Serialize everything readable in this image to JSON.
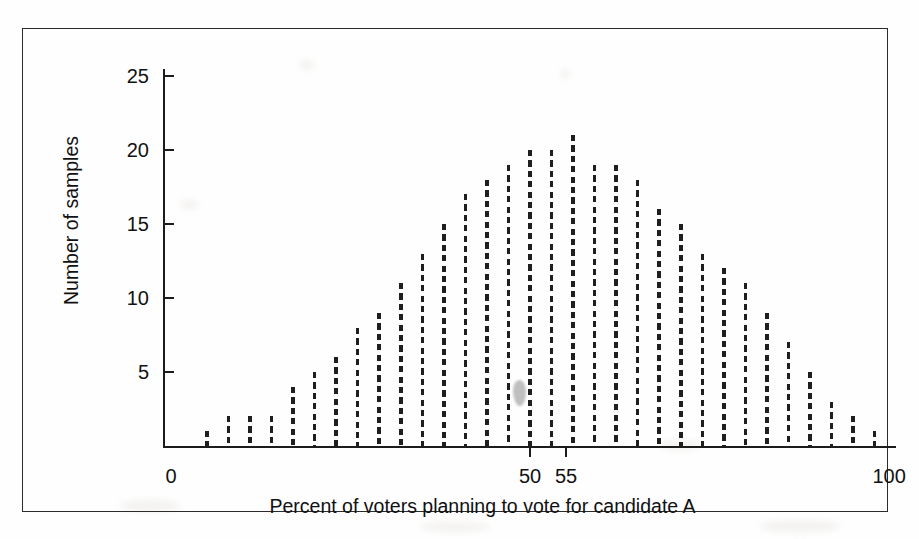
{
  "figure": {
    "frame_color": "#2b2b2b",
    "background": "#ffffff"
  },
  "chart_data": {
    "type": "bar",
    "title": "",
    "subtitle": "",
    "xlabel": "Percent of voters planning to vote for candidate A",
    "ylabel": "Number of samples",
    "xlim": [
      0,
      100
    ],
    "ylim": [
      0,
      25
    ],
    "grid": false,
    "legend": null,
    "bar_style": "dashed vertical lines",
    "bar_color": "#1f1f1f",
    "x_tick_labels": [
      "0",
      "50",
      "55",
      "100"
    ],
    "x_tick_values": [
      0,
      50,
      55,
      100
    ],
    "y_tick_labels": [
      "5",
      "10",
      "15",
      "20",
      "25"
    ],
    "y_tick_values": [
      5,
      10,
      15,
      20,
      25
    ],
    "categories": [
      5,
      8,
      11,
      14,
      17,
      20,
      23,
      26,
      29,
      32,
      35,
      38,
      41,
      44,
      47,
      50,
      53,
      56,
      59,
      62,
      65,
      68,
      71,
      74,
      77,
      80,
      83,
      86,
      89,
      92,
      95,
      98
    ],
    "values": [
      1,
      2,
      2,
      2,
      4,
      5,
      6,
      8,
      9,
      11,
      13,
      15,
      17,
      18,
      19,
      20,
      20,
      21,
      19,
      19,
      18,
      16,
      15,
      13,
      12,
      11,
      9,
      7,
      5,
      3,
      2,
      1
    ],
    "annotations": [
      {
        "name": "smudge-artifact",
        "x_percent": 48.5,
        "y_value": 3.6,
        "color": "#b9b9b9"
      }
    ]
  },
  "axis_titles": {
    "x": "Percent of voters planning to vote for candidate A",
    "y": "Number of samples"
  }
}
